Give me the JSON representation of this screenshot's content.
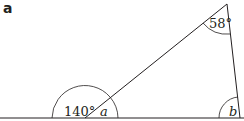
{
  "part_label": "a",
  "angles": {
    "exterior": "140°",
    "top": "58°",
    "a": "a",
    "b": "b"
  },
  "colors": {
    "stroke": "#231f20",
    "background": "#ffffff"
  }
}
